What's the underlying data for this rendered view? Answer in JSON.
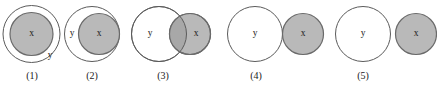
{
  "figure": {
    "type": "set-relation-diagram-series",
    "background_color": "#ffffff",
    "shaded_fill_color": "#b9b9b9",
    "shaded_stroke_color": "#6a6a6a",
    "outline_fill_color": "#ffffff",
    "outline_stroke_color": "#5b5b5b",
    "overlap_fill_color": "#a8a8a8",
    "label_color": "#1a1a1a"
  },
  "panels": [
    {
      "caption": "(1)",
      "caption_x": 32,
      "caption_y": 79,
      "relation": "x contained inside y",
      "y_circle": {
        "label": "y",
        "cx": 31.5,
        "cy": 34,
        "r": 28.5,
        "label_x": 50,
        "label_y": 56
      },
      "x_circle": {
        "label": "x",
        "cx": 31.5,
        "cy": 34,
        "r": 21.5,
        "label_x": 31.5,
        "label_y": 34
      }
    },
    {
      "caption": "(2)",
      "caption_x": 92,
      "caption_y": 79,
      "relation": "x internally tangent inside y",
      "y_circle": {
        "label": "y",
        "cx": 92,
        "cy": 34,
        "r": 27.5,
        "label_x": 72,
        "label_y": 34
      },
      "x_circle": {
        "label": "x",
        "cx": 99,
        "cy": 34,
        "r": 20.5,
        "label_x": 99,
        "label_y": 34
      }
    },
    {
      "caption": "(3)",
      "caption_x": 163,
      "caption_y": 79,
      "relation": "x and y overlapping",
      "y_circle": {
        "label": "y",
        "cx": 159,
        "cy": 34,
        "r": 27.5,
        "label_x": 150,
        "label_y": 34
      },
      "x_circle": {
        "label": "x",
        "cx": 190,
        "cy": 34,
        "r": 20.5,
        "label_x": 196,
        "label_y": 34
      }
    },
    {
      "caption": "(4)",
      "caption_x": 256,
      "caption_y": 79,
      "relation": "x and y externally tangent",
      "y_circle": {
        "label": "y",
        "cx": 255,
        "cy": 34,
        "r": 27.5,
        "label_x": 255,
        "label_y": 34
      },
      "x_circle": {
        "label": "x",
        "cx": 303,
        "cy": 34,
        "r": 20.5,
        "label_x": 303,
        "label_y": 34
      }
    },
    {
      "caption": "(5)",
      "caption_x": 363,
      "caption_y": 79,
      "relation": "x and y separate",
      "y_circle": {
        "label": "y",
        "cx": 363,
        "cy": 34,
        "r": 27.5,
        "label_x": 363,
        "label_y": 34
      },
      "x_circle": {
        "label": "x",
        "cx": 416,
        "cy": 34,
        "r": 20.5,
        "label_x": 416,
        "label_y": 34
      }
    }
  ]
}
